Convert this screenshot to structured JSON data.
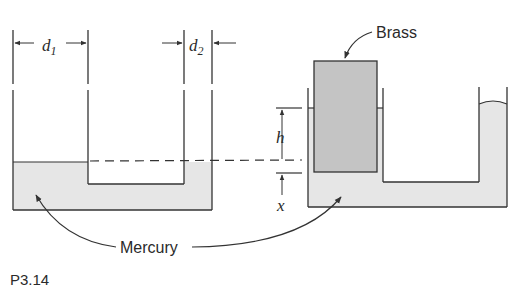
{
  "figure": {
    "caption": "P3.14",
    "colors": {
      "mercury": "#e6e6e6",
      "brass": "#c4c4c4",
      "line": "#333333"
    }
  },
  "labels": {
    "d1": {
      "var": "d",
      "sub": "1"
    },
    "d2": {
      "var": "d",
      "sub": "2"
    },
    "h": "h",
    "x": "x",
    "brass": "Brass",
    "mercury": "Mercury"
  }
}
